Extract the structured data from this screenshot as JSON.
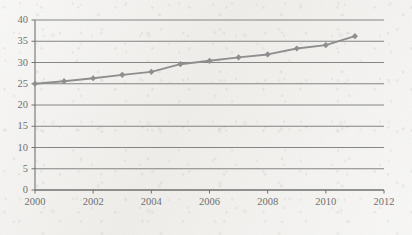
{
  "chart_data": {
    "type": "line",
    "title": "",
    "subtitle": "",
    "xlabel": "",
    "ylabel": "",
    "x": [
      2000,
      2001,
      2002,
      2003,
      2004,
      2005,
      2006,
      2007,
      2008,
      2009,
      2010,
      2011
    ],
    "values": [
      25.0,
      25.6,
      26.3,
      27.1,
      27.8,
      29.6,
      30.4,
      31.2,
      31.9,
      33.3,
      34.1,
      36.2
    ],
    "series": [
      {
        "name": "",
        "values": [
          25.0,
          25.6,
          26.3,
          27.1,
          27.8,
          29.6,
          30.4,
          31.2,
          31.9,
          33.3,
          34.1,
          36.2
        ]
      }
    ],
    "xlim": [
      2000,
      2012
    ],
    "ylim": [
      0,
      40
    ],
    "x_ticks": [
      2000,
      2002,
      2004,
      2006,
      2008,
      2010,
      2012
    ],
    "x_tick_labels": [
      "2000",
      "2002",
      "2004",
      "2006",
      "2008",
      "2010",
      "2012"
    ],
    "y_ticks": [
      0,
      5,
      10,
      15,
      20,
      25,
      30,
      35,
      40
    ],
    "y_tick_labels": [
      "0",
      "5",
      "10",
      "15",
      "20",
      "25",
      "30",
      "35",
      "40"
    ],
    "grid": "horizontal",
    "legend": "none",
    "annotations": [],
    "style": {
      "line_color": "#8d8d8d",
      "marker_color": "#8d8d8d",
      "marker_shape": "diamond",
      "gridline_color": "#6f6f6f",
      "axis_color": "#6f6f6f",
      "tick_label_color": "#6d6d6d",
      "background_color": "#f3f2ef"
    }
  }
}
